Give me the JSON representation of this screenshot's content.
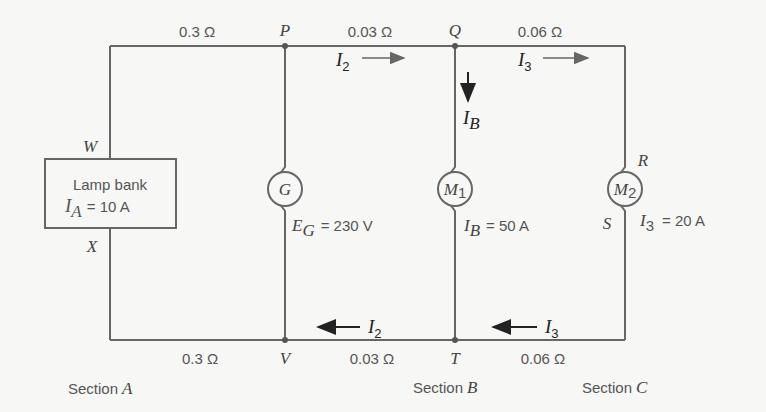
{
  "diagram": {
    "type": "dc-distribution-circuit",
    "top_resistances": [
      "0.3 Ω",
      "0.03 Ω",
      "0.06 Ω"
    ],
    "bottom_resistances": [
      "0.3 Ω",
      "0.03 Ω",
      "0.06 Ω"
    ],
    "nodes": {
      "P": "P",
      "Q": "Q",
      "R": "R",
      "S": "S",
      "T": "T",
      "V": "V",
      "W": "W",
      "X": "X"
    },
    "lamp_bank": {
      "title": "Lamp bank",
      "current_symbol": "I",
      "current_sub": "A",
      "current_value": "= 10 A"
    },
    "generator": {
      "symbol": "G",
      "emf_symbol": "E",
      "emf_sub": "G",
      "emf_value": "= 230 V"
    },
    "motor1": {
      "symbol": "M",
      "sub": "1",
      "current_symbol": "I",
      "current_sub": "B",
      "current_value": "= 50 A"
    },
    "motor2": {
      "symbol": "M",
      "sub": "2",
      "current_symbol": "I",
      "current_sub": "3",
      "current_value": "= 20 A"
    },
    "currents": {
      "top_i2": {
        "symbol": "I",
        "sub": "2"
      },
      "top_i3": {
        "symbol": "I",
        "sub": "3"
      },
      "branch_ib": {
        "symbol": "I",
        "sub": "B"
      },
      "bottom_i2": {
        "symbol": "I",
        "sub": "2"
      },
      "bottom_i3": {
        "symbol": "I",
        "sub": "3"
      }
    },
    "sections": [
      {
        "prefix": "Section",
        "letter": "A"
      },
      {
        "prefix": "Section",
        "letter": "B"
      },
      {
        "prefix": "Section",
        "letter": "C"
      }
    ],
    "colors": {
      "wire": "#666666",
      "arrow": "#222222",
      "background": "#f7f7f5"
    }
  }
}
